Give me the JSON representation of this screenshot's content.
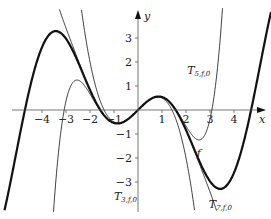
{
  "chart_data": {
    "type": "line",
    "title": "",
    "xlabel": "x",
    "ylabel": "y",
    "xlim": [
      -5.1,
      5.2
    ],
    "ylim": [
      -4.4,
      4.1
    ],
    "grid": false,
    "xticks": [
      -4,
      -3,
      -2,
      -1,
      1,
      2,
      3,
      4
    ],
    "yticks": [
      -3,
      -2,
      -1,
      1,
      2,
      3
    ],
    "series": [
      {
        "name": "f",
        "expression": "x*cos(x)",
        "coeffs": null,
        "width": 2.2,
        "label_pos": [
          2.45,
          -1.95
        ]
      },
      {
        "name": "T3,f,0",
        "coeffs": [
          0,
          1,
          0,
          -0.5
        ],
        "width": 0.8,
        "label_pos": [
          -1.0,
          -3.75
        ]
      },
      {
        "name": "T5,f,0",
        "coeffs": [
          0,
          1,
          0,
          -0.5,
          0,
          0.0416667
        ],
        "width": 0.8,
        "label_pos": [
          2.05,
          1.5
        ]
      },
      {
        "name": "T7,f,0",
        "coeffs": [
          0,
          1,
          0,
          -0.5,
          0,
          0.0416667,
          0,
          -0.00138889
        ],
        "width": 0.8,
        "label_pos": [
          2.95,
          -4.1
        ]
      }
    ],
    "labels": {
      "f": "f",
      "T3": {
        "main": "T",
        "sub": "3,f,0"
      },
      "T5": {
        "main": "T",
        "sub": "5,f,0"
      },
      "T7": {
        "main": "T",
        "sub": "7,f,0"
      }
    }
  }
}
